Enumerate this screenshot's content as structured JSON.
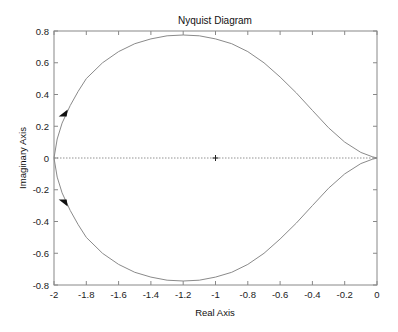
{
  "chart_data": {
    "type": "line",
    "title": "Nyquist Diagram",
    "xlabel": "Real Axis",
    "ylabel": "Imaginary Axis",
    "xlim": [
      -2,
      0
    ],
    "ylim": [
      -0.8,
      0.8
    ],
    "grid": false,
    "xticks": [
      -2,
      -1.8,
      -1.6,
      -1.4,
      -1.2,
      -1,
      -0.8,
      -0.6,
      -0.4,
      -0.2,
      0
    ],
    "xtick_labels": [
      "-2",
      "-1.8",
      "-1.6",
      "-1.4",
      "-1.2",
      "-1",
      "-0.8",
      "-0.6",
      "-0.4",
      "-0.2",
      "0"
    ],
    "yticks": [
      0.8,
      0.6,
      0.4,
      0.2,
      0,
      -0.2,
      -0.4,
      -0.6,
      -0.8
    ],
    "ytick_labels": [
      "0.8",
      "0.6",
      "0.4",
      "0.2",
      "0",
      "-0.2",
      "-0.4",
      "-0.6",
      "-0.8"
    ],
    "series": [
      {
        "name": "positive frequencies",
        "x": [
          -2.0,
          -1.98,
          -1.95,
          -1.9,
          -1.85,
          -1.8,
          -1.7,
          -1.6,
          -1.5,
          -1.4,
          -1.3,
          -1.2,
          -1.1,
          -1.0,
          -0.9,
          -0.8,
          -0.7,
          -0.6,
          -0.5,
          -0.4,
          -0.3,
          -0.2,
          -0.1,
          -0.03,
          0.0
        ],
        "y": [
          0.0,
          -0.12,
          -0.22,
          -0.33,
          -0.42,
          -0.5,
          -0.6,
          -0.67,
          -0.72,
          -0.75,
          -0.77,
          -0.775,
          -0.77,
          -0.75,
          -0.72,
          -0.67,
          -0.6,
          -0.51,
          -0.41,
          -0.3,
          -0.19,
          -0.1,
          -0.035,
          -0.008,
          0.0
        ]
      },
      {
        "name": "negative frequencies",
        "x": [
          -2.0,
          -1.98,
          -1.95,
          -1.9,
          -1.85,
          -1.8,
          -1.7,
          -1.6,
          -1.5,
          -1.4,
          -1.3,
          -1.2,
          -1.1,
          -1.0,
          -0.9,
          -0.8,
          -0.7,
          -0.6,
          -0.5,
          -0.4,
          -0.3,
          -0.2,
          -0.1,
          -0.03,
          0.0
        ],
        "y": [
          0.0,
          0.12,
          0.22,
          0.33,
          0.42,
          0.5,
          0.6,
          0.67,
          0.72,
          0.75,
          0.77,
          0.775,
          0.77,
          0.75,
          0.72,
          0.67,
          0.6,
          0.51,
          0.41,
          0.3,
          0.19,
          0.1,
          0.035,
          0.008,
          0.0
        ]
      }
    ],
    "annotations": [
      {
        "type": "marker",
        "shape": "plus",
        "x": -1,
        "y": 0,
        "label": "critical point"
      },
      {
        "type": "arrow",
        "x": -1.94,
        "y": 0.28,
        "direction": "down-left"
      },
      {
        "type": "arrow",
        "x": -1.94,
        "y": -0.28,
        "direction": "down-right"
      },
      {
        "type": "dashed-line",
        "y": 0,
        "label": "real axis reference"
      }
    ],
    "colors": {
      "curve": "#8a8a8a",
      "axes": "#888888",
      "zero_line": "#777777",
      "arrow": "#111111"
    }
  }
}
